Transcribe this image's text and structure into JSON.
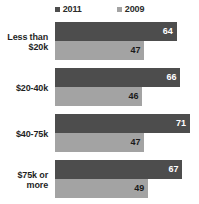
{
  "chart_data": {
    "type": "bar",
    "orientation": "horizontal",
    "title": "",
    "subtitle": "",
    "xlabel": "",
    "ylabel": "",
    "grid": false,
    "legend_position": "top-center",
    "xlim": [
      0,
      75
    ],
    "categories": [
      "Less than $20k",
      "$20-40k",
      "$40-75k",
      "$75k or more"
    ],
    "series": [
      {
        "name": "2011",
        "color": "#4d4d4d",
        "values": [
          64,
          66,
          71,
          67
        ]
      },
      {
        "name": "2009",
        "color": "#a3a3a3",
        "values": [
          47,
          46,
          47,
          49
        ]
      }
    ],
    "groups": [
      {
        "label_line1": "Less than",
        "label_line2": "$20k",
        "bars": [
          {
            "series": "2011",
            "value": 64,
            "value_label": "64"
          },
          {
            "series": "2009",
            "value": 47,
            "value_label": "47"
          }
        ]
      },
      {
        "label_line1": "$20-40k",
        "label_line2": "",
        "bars": [
          {
            "series": "2011",
            "value": 66,
            "value_label": "66"
          },
          {
            "series": "2009",
            "value": 46,
            "value_label": "46"
          }
        ]
      },
      {
        "label_line1": "$40-75k",
        "label_line2": "",
        "bars": [
          {
            "series": "2011",
            "value": 71,
            "value_label": "71"
          },
          {
            "series": "2009",
            "value": 47,
            "value_label": "47"
          }
        ]
      },
      {
        "label_line1": "$75k or",
        "label_line2": "more",
        "bars": [
          {
            "series": "2011",
            "value": 67,
            "value_label": "67"
          },
          {
            "series": "2009",
            "value": 49,
            "value_label": "49"
          }
        ]
      }
    ]
  },
  "legend": {
    "items": [
      {
        "label": "2011",
        "color": "#4d4d4d"
      },
      {
        "label": "2009",
        "color": "#a3a3a3"
      }
    ]
  },
  "colors": {
    "series_2011": "#4d4d4d",
    "series_2009": "#a3a3a3",
    "background": "#ffffff",
    "text": "#1f1f1f",
    "value_light": "#ffffff",
    "value_dark": "#1a1a1a"
  },
  "scale": {
    "max_value": 75,
    "pixels_per_unit": 1.9,
    "bar_area_width_px": 144
  }
}
